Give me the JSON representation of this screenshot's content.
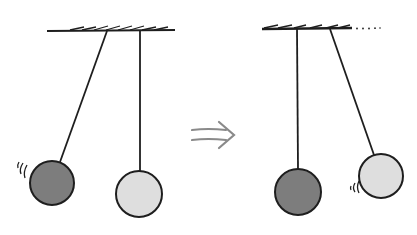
{
  "diagram": {
    "title": "Pendulum collision: momentum transfer",
    "colors": {
      "background": "#ffffff",
      "line": "#1e1e1e",
      "bob_dark": "#7d7d7d",
      "bob_light": "#dedede",
      "arrow": "#8a8a8a"
    },
    "panels": [
      {
        "id": "before",
        "label": "Before",
        "ceiling": {
          "x1": 47,
          "x2": 175,
          "y": 31
        },
        "pendulums": [
          {
            "name": "dark-bob",
            "pivot": [
              107,
              31
            ],
            "bob": [
              52,
              183
            ],
            "r": 22,
            "fill": "bob_dark",
            "motion_lines": "left"
          },
          {
            "name": "light-bob",
            "pivot": [
              140,
              31
            ],
            "bob": [
              139,
              194
            ],
            "r": 23,
            "fill": "bob_light",
            "motion_lines": "none"
          }
        ]
      },
      {
        "id": "after",
        "label": "After",
        "ceiling": {
          "x1": 262,
          "x2": 352,
          "y": 29,
          "dotted_extension_to": 380
        },
        "pendulums": [
          {
            "name": "dark-bob",
            "pivot": [
              297,
              29
            ],
            "bob": [
              298,
              192
            ],
            "r": 23,
            "fill": "bob_dark",
            "motion_lines": "none"
          },
          {
            "name": "light-bob",
            "pivot": [
              330,
              29
            ],
            "bob": [
              381,
              176
            ],
            "r": 22,
            "fill": "bob_light",
            "motion_lines": "left"
          }
        ]
      }
    ],
    "transition_arrow": {
      "symbol": "⇒",
      "x": 190,
      "y": 134
    }
  }
}
